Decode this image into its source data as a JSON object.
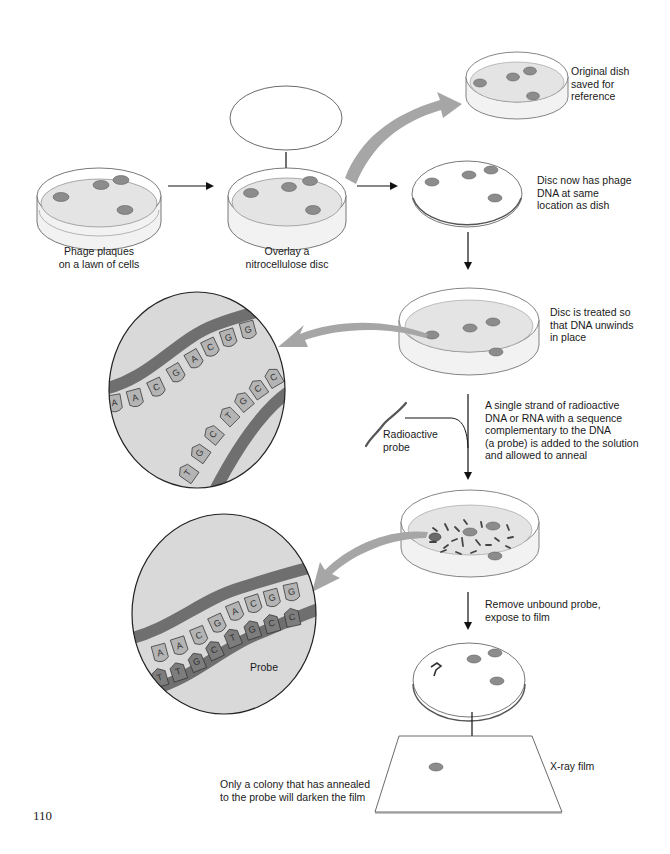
{
  "page_number": "110",
  "colors": {
    "dish_fill": "#e4e4e4",
    "plaque": "#8c8c8c",
    "big_arrow": "#a6a6a6",
    "strand": "#6f6f6f",
    "base_light": "#b4b4b4",
    "base_dark": "#7d7d7d",
    "magnifier_bg": "#d9d9d9"
  },
  "steps": {
    "plaques": {
      "label": "Phage plaques\non a lawn of cells"
    },
    "overlay": {
      "label": "Overlay a\nnitrocellulose disc"
    },
    "original_dish": {
      "label": "Original dish\nsaved for\nreference"
    },
    "disc_copy": {
      "label": "Disc now has phage\nDNA at same\nlocation as dish"
    },
    "treated": {
      "label": "Disc is treated so\nthat DNA unwinds\nin place"
    },
    "probe_added": {
      "label": "A single strand of radioactive\nDNA or RNA with a sequence\ncomplementary to the DNA\n(a probe) is added to the solution\nand allowed to anneal"
    },
    "radioactive_probe": {
      "label": "Radioactive\nprobe"
    },
    "remove_unbound": {
      "label": "Remove unbound probe,\nexpose to film"
    },
    "xray_film": {
      "label": "X-ray film"
    },
    "result": {
      "label": "Only a colony that has annealed\nto the probe will darken the film"
    }
  },
  "magnifier_unwound": {
    "top_strand_bases": [
      "A",
      "A",
      "C",
      "G",
      "A",
      "C",
      "G",
      "G"
    ],
    "bottom_strand_bases": [
      "T",
      "G",
      "C",
      "T",
      "G",
      "C",
      "C"
    ]
  },
  "magnifier_annealed": {
    "top_strand_bases": [
      "A",
      "A",
      "C",
      "G",
      "A",
      "C",
      "G",
      "G"
    ],
    "probe_bases": [
      "T",
      "T",
      "G",
      "C",
      "T",
      "G",
      "C",
      "C"
    ],
    "probe_label": "Probe"
  }
}
